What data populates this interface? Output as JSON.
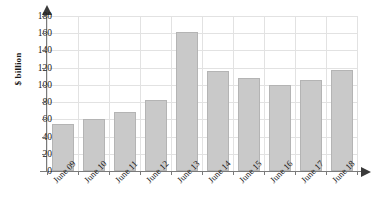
{
  "chart_data": {
    "type": "bar",
    "title": "",
    "xlabel": "",
    "ylabel": "$ billion",
    "categories": [
      "June 09",
      "June 10",
      "June 11",
      "June 12",
      "June 13",
      "June 14",
      "June 15",
      "June 16",
      "June 17",
      "June 18"
    ],
    "values": [
      55,
      60,
      68,
      82,
      162,
      116,
      108,
      100,
      106,
      117
    ],
    "ylim": [
      0,
      180
    ],
    "yticks": [
      0,
      20,
      40,
      60,
      80,
      100,
      120,
      140,
      160,
      180
    ],
    "ytick_labels": [
      "0",
      "20",
      "40",
      "60",
      "80",
      "100",
      "120",
      "140",
      "160",
      "180"
    ],
    "grid": true,
    "legend": null,
    "bar_color": "#c9c9c9",
    "bar_border_color": "#b4b4b4",
    "grid_color": "#e2e2e2",
    "axis_color": "#7a7a7a"
  }
}
